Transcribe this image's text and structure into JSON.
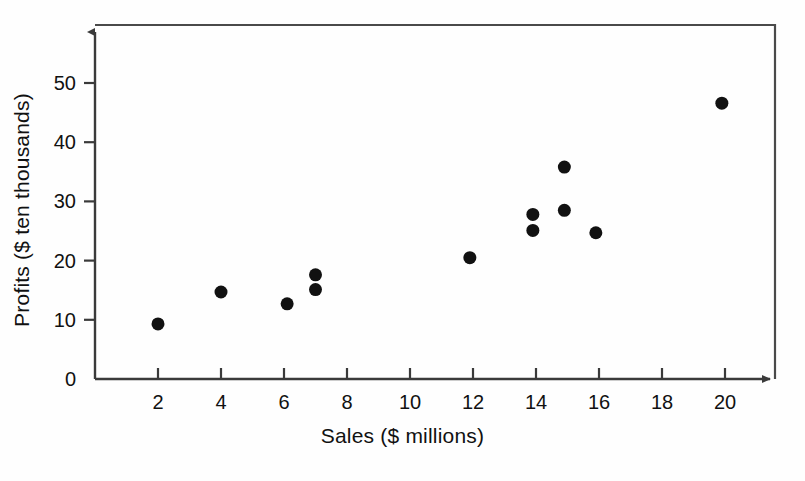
{
  "chart_data": {
    "type": "scatter",
    "title": "",
    "xlabel": "Sales ($ millions)",
    "ylabel": "Profits ($ ten thousands)",
    "xlim": [
      0,
      22
    ],
    "ylim": [
      0,
      55
    ],
    "xticks": [
      2,
      4,
      6,
      8,
      10,
      12,
      14,
      16,
      18,
      20
    ],
    "yticks": [
      0,
      10,
      20,
      30,
      40,
      50
    ],
    "xtick_labels": [
      "2",
      "4",
      "6",
      "8",
      "10",
      "12",
      "14",
      "16",
      "18",
      "20"
    ],
    "ytick_labels": [
      "0",
      "10",
      "20",
      "30",
      "40",
      "50"
    ],
    "grid": false,
    "legend": null,
    "marker": "filled-circle",
    "marker_color": "#111111",
    "marker_size": 13,
    "axis_color": "#3a3a3a",
    "points": [
      {
        "x": 2.0,
        "y": 9.3,
        "label": "point-1"
      },
      {
        "x": 4.0,
        "y": 14.7,
        "label": "point-2"
      },
      {
        "x": 6.1,
        "y": 12.7,
        "label": "point-3"
      },
      {
        "x": 7.0,
        "y": 17.6,
        "label": "point-4"
      },
      {
        "x": 7.0,
        "y": 15.1,
        "label": "point-5"
      },
      {
        "x": 11.9,
        "y": 20.5,
        "label": "point-6"
      },
      {
        "x": 13.9,
        "y": 27.8,
        "label": "point-7"
      },
      {
        "x": 13.9,
        "y": 25.1,
        "label": "point-8"
      },
      {
        "x": 14.9,
        "y": 35.8,
        "label": "point-9"
      },
      {
        "x": 14.9,
        "y": 28.5,
        "label": "point-10"
      },
      {
        "x": 15.9,
        "y": 24.7,
        "label": "point-11"
      },
      {
        "x": 19.9,
        "y": 46.6,
        "label": "point-12"
      }
    ]
  }
}
